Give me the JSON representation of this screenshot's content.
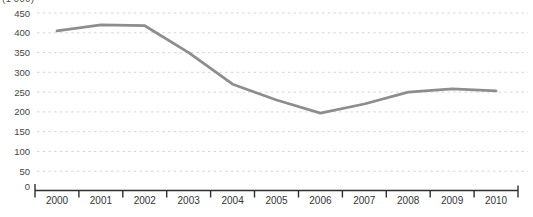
{
  "chart_data": {
    "type": "line",
    "title": "",
    "unit_label": "(1'000)",
    "categories": [
      "2000",
      "2001",
      "2002",
      "2003",
      "2004",
      "2005",
      "2006",
      "2007",
      "2008",
      "2009",
      "2010"
    ],
    "series": [
      {
        "name": "value",
        "values": [
          405,
          420,
          418,
          350,
          270,
          230,
          197,
          220,
          250,
          258,
          253
        ]
      }
    ],
    "xlabel": "",
    "ylabel": "",
    "ylim": [
      0,
      450
    ],
    "ytick_step": 50,
    "yticks": [
      0,
      50,
      100,
      150,
      200,
      250,
      300,
      350,
      400,
      450
    ],
    "grid": "horizontal-dashed",
    "legend": "none"
  },
  "style": {
    "line_color": "#8d8d8d",
    "grid_color": "#d4d4d4",
    "axis_color": "#2f2f2f",
    "y_label_color": "#454545",
    "x_label_color": "#333333",
    "background": "#ffffff"
  }
}
